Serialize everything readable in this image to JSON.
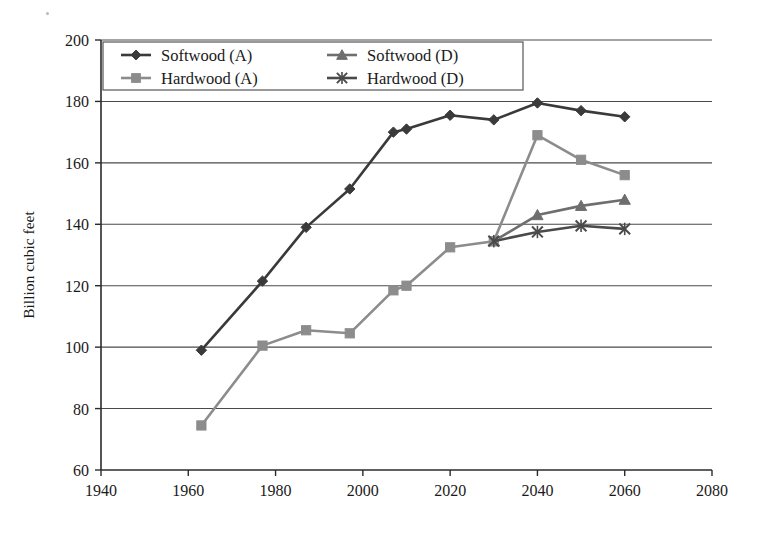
{
  "chart_data": {
    "type": "line",
    "title": "",
    "subtitle": "",
    "xlabel": "",
    "ylabel": "Billion cubic feet",
    "xlim": [
      1940,
      2080
    ],
    "ylim": [
      60,
      200
    ],
    "xticks": [
      1940,
      1960,
      1980,
      2000,
      2020,
      2040,
      2060,
      2080
    ],
    "yticks": [
      60,
      80,
      100,
      120,
      140,
      160,
      180,
      200
    ],
    "grid": "horizontal",
    "legend_position": "top-left-inside",
    "series": [
      {
        "name": "Softwood (A)",
        "marker": "diamond",
        "color": "#3a3a3a",
        "x": [
          1963,
          1977,
          1987,
          1997,
          2007,
          2010,
          2020,
          2030,
          2040,
          2050,
          2060
        ],
        "values": [
          99,
          121.5,
          139,
          151.5,
          170,
          171,
          175.5,
          174,
          179.5,
          177,
          175
        ]
      },
      {
        "name": "Softwood (D)",
        "marker": "triangle",
        "color": "#6e6e6e",
        "x": [
          2030,
          2040,
          2050,
          2060
        ],
        "values": [
          134.5,
          143,
          146,
          148
        ]
      },
      {
        "name": "Hardwood (A)",
        "marker": "square",
        "color": "#8c8c8c",
        "x": [
          1963,
          1977,
          1987,
          1997,
          2007,
          2010,
          2020,
          2030,
          2040,
          2050,
          2060
        ],
        "values": [
          74.5,
          100.5,
          105.5,
          104.5,
          118.5,
          120,
          132.5,
          134.5,
          169,
          161,
          156
        ]
      },
      {
        "name": "Hardwood (D)",
        "marker": "star",
        "color": "#4a4a4a",
        "x": [
          2030,
          2040,
          2050,
          2060
        ],
        "values": [
          134.5,
          137.5,
          139.5,
          138.5
        ]
      }
    ],
    "legend": [
      {
        "label": "Softwood (A)",
        "marker": "diamond",
        "color": "#3a3a3a"
      },
      {
        "label": "Softwood (D)",
        "marker": "triangle",
        "color": "#6e6e6e"
      },
      {
        "label": "Hardwood (A)",
        "marker": "square",
        "color": "#8c8c8c"
      },
      {
        "label": "Hardwood (D)",
        "marker": "star",
        "color": "#4a4a4a"
      }
    ]
  },
  "axes": {
    "y_axis_title": "Billion cubic feet",
    "y_tick_labels": [
      "200",
      "180",
      "160",
      "140",
      "120",
      "100",
      "80",
      "60"
    ],
    "x_tick_labels": [
      "1940",
      "1960",
      "1980",
      "2000",
      "2020",
      "2040",
      "2060",
      "2080"
    ]
  },
  "legend_labels": {
    "softwood_a": "Softwood (A)",
    "softwood_d": "Softwood (D)",
    "hardwood_a": "Hardwood (A)",
    "hardwood_d": "Hardwood (D)"
  },
  "colors": {
    "softwood_a": "#3a3a3a",
    "softwood_d": "#6e6e6e",
    "hardwood_a": "#8c8c8c",
    "hardwood_d": "#4a4a4a",
    "axis": "#2b2b2b",
    "grid": "#4a4a4a",
    "background": "#ffffff"
  }
}
